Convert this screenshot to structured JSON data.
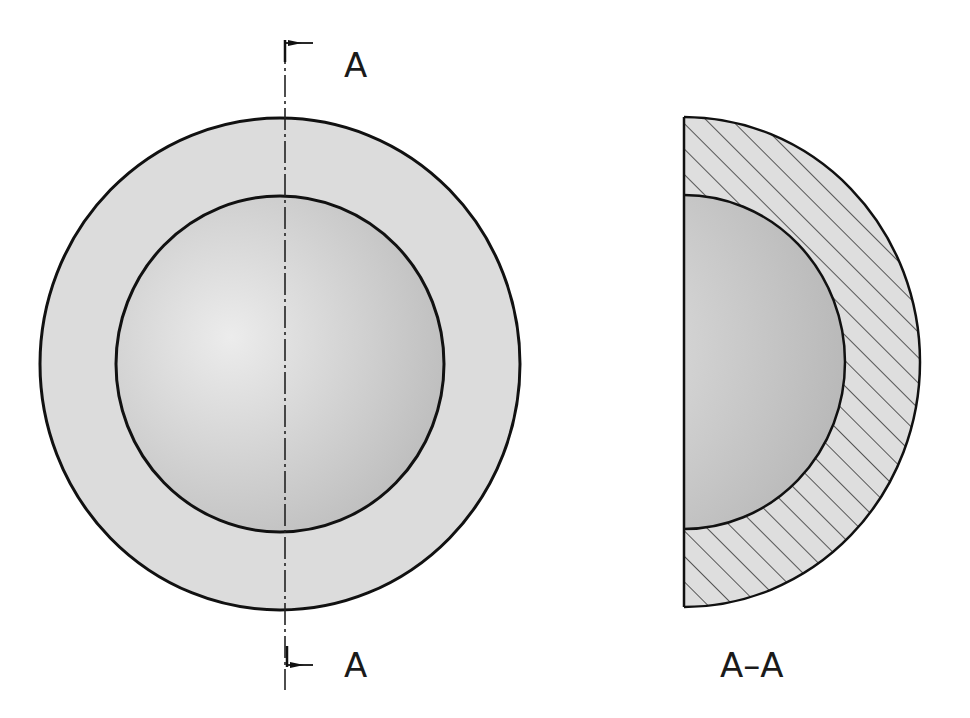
{
  "diagram": {
    "type": "engineering-section-view",
    "front_view": {
      "name": "hollow-sphere-front-view",
      "section_line": {
        "top_label": "A",
        "bottom_label": "A"
      }
    },
    "section_view": {
      "name": "section-view-a-a",
      "label": "A–A",
      "hatch": "diagonal-45"
    },
    "colors": {
      "outline": "#111111",
      "shell_fill": "#dcdcdc",
      "inner_light": "#ececec",
      "inner_dark": "#b8b8b8",
      "hatch": "#333333",
      "background": "#ffffff"
    }
  }
}
